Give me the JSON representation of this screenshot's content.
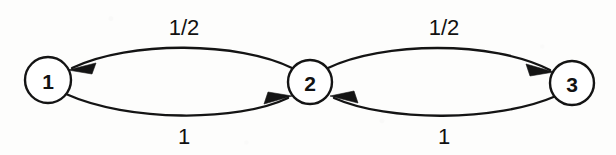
{
  "diagram": {
    "kind": "markov-chain-state-transition-diagram",
    "background_color": "#fdfdfc",
    "stroke_color": "#141414",
    "node_fill_color": "#ffffff",
    "nodes": [
      {
        "id": "1",
        "label": "1",
        "cx": 48,
        "cy": 80,
        "r": 23
      },
      {
        "id": "2",
        "label": "2",
        "cx": 310,
        "cy": 82,
        "r": 22
      },
      {
        "id": "3",
        "label": "3",
        "cx": 572,
        "cy": 83,
        "r": 22
      }
    ],
    "edges": [
      {
        "id": "edge-2-to-1",
        "from": "2",
        "to": "1",
        "label": "1/2",
        "label_x": 184,
        "label_y": 27,
        "position": "top-left",
        "arrow_direction": "left"
      },
      {
        "id": "edge-1-to-2",
        "from": "1",
        "to": "2",
        "label": "1",
        "label_x": 184,
        "label_y": 136,
        "position": "bottom-left",
        "arrow_direction": "right"
      },
      {
        "id": "edge-2-to-3",
        "from": "2",
        "to": "3",
        "label": "1/2",
        "label_x": 444,
        "label_y": 27,
        "position": "top-right",
        "arrow_direction": "right"
      },
      {
        "id": "edge-3-to-2",
        "from": "3",
        "to": "2",
        "label": "1",
        "label_x": 444,
        "label_y": 136,
        "position": "bottom-right",
        "arrow_direction": "left"
      }
    ]
  }
}
